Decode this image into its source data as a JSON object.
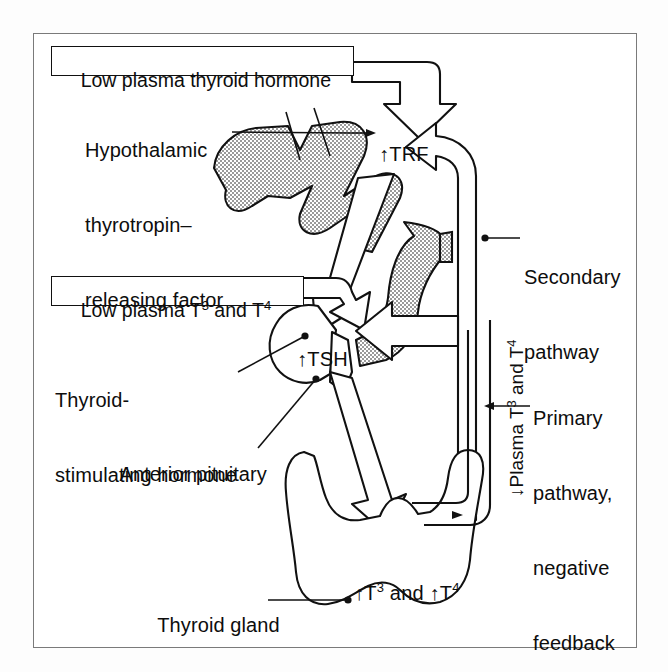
{
  "figure": {
    "domain_title": "Thyroid hormone regulation feedback diagram",
    "frame_border_color": "#7a7a7a",
    "ink_color": "#0d0d0d",
    "stipple_color": "#c8c8c8"
  },
  "boxes": {
    "low_plasma_thyroid_hormone": "Low plasma thyroid hormone",
    "low_plasma_t3_t4_pre": "Low plasma T",
    "low_plasma_t3_t4_sup1": "3",
    "low_plasma_t3_t4_mid": " and T",
    "low_plasma_t3_t4_sup2": "4"
  },
  "labels": {
    "hypothalamic_line1": "Hypothalamic",
    "hypothalamic_line2": "thyrotropin–",
    "hypothalamic_line3": "releasing factor",
    "secondary_line1": "Secondary",
    "secondary_line2": "pathway",
    "tsh_line1": "Thyroid-",
    "tsh_line2": "stimulating hormone",
    "anterior_pituitary": "Anterior pituitary",
    "primary_line1": "Primary",
    "primary_line2": "pathway,",
    "primary_line3": "negative",
    "primary_line4": "feedback",
    "thyroid_gland": "Thyroid gland"
  },
  "hormones": {
    "trf_arrow": "↑",
    "trf": "TRF",
    "tsh_arrow": "↑",
    "tsh": "TSH",
    "output_arrow1": "↑",
    "output_t": "T",
    "output_sup1": "3",
    "output_and": " and ",
    "output_arrow2": "↑",
    "output_t2": "T",
    "output_sup2": "4"
  },
  "vertical_label": {
    "arrow": "↓",
    "pre": "Plasma T",
    "sup1": "3",
    "mid": " and T",
    "sup2": "4"
  }
}
